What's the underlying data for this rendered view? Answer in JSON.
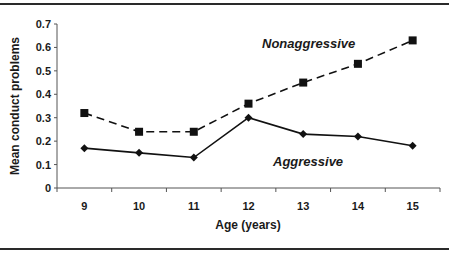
{
  "chart_data": {
    "type": "line",
    "title": "",
    "xlabel": "Age (years)",
    "ylabel": "Mean conduct problems",
    "categories": [
      "9",
      "10",
      "11",
      "12",
      "13",
      "14",
      "15"
    ],
    "ylim": [
      0,
      0.7
    ],
    "yticks": [
      "0",
      "0.1",
      "0.2",
      "0.3",
      "0.4",
      "0.5",
      "0.6",
      "0.7"
    ],
    "grid": false,
    "legend": "inline labels",
    "series": [
      {
        "name": "Nonaggressive",
        "style": "dashed",
        "marker": "square",
        "values": [
          0.32,
          0.24,
          0.24,
          0.36,
          0.45,
          0.53,
          0.63
        ]
      },
      {
        "name": "Aggressive",
        "style": "solid",
        "marker": "diamond",
        "values": [
          0.17,
          0.15,
          0.13,
          0.3,
          0.23,
          0.22,
          0.18
        ]
      }
    ]
  },
  "labels": {
    "nonaggressive": "Nonaggressive",
    "aggressive": "Aggressive",
    "x_axis_title": "Age (years)",
    "y_axis_title": "Mean conduct problems"
  },
  "colors": {
    "line": "#111111",
    "rule": "#2a2a2a",
    "axis": "#555555"
  }
}
